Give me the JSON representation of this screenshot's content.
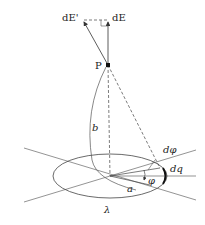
{
  "diagram": {
    "labels": {
      "dE_prime": "dE'",
      "dE": "dE",
      "point": "P",
      "height": "b",
      "radius": "a",
      "angle": "φ",
      "dangle": "dφ",
      "charge": "dq",
      "line_density": "λ"
    },
    "colors": {
      "stroke": "#555555",
      "ink": "#222222"
    }
  }
}
